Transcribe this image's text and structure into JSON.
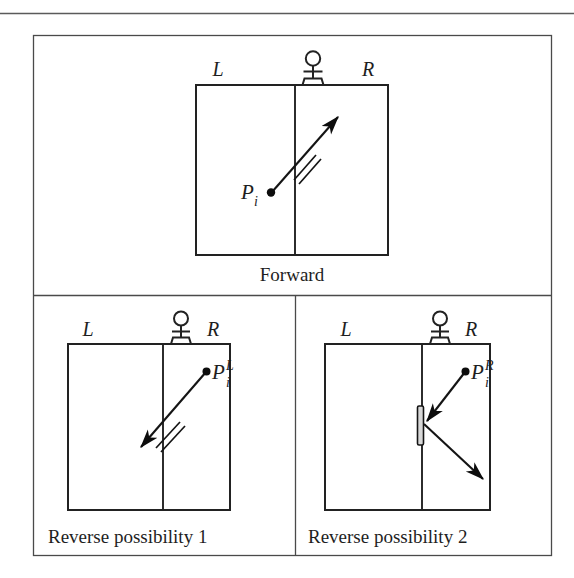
{
  "figure": {
    "name": "forward-reverse-possibility-diagram",
    "top_rule": true,
    "panels": [
      {
        "id": "forward",
        "caption": "Forward",
        "caption_align": "center",
        "left_label": "L",
        "right_label": "R",
        "sensor_icon": "antenna-sensor-icon",
        "point_label_base": "P",
        "point_label_sub": "i",
        "point_label_sup": "",
        "arrow_count": 1,
        "arrow_direction": "up-right",
        "has_tick_mark": true,
        "has_wall_segment": false
      },
      {
        "id": "reverse-possibility-1",
        "caption": "Reverse possibility 1",
        "caption_align": "left",
        "left_label": "L",
        "right_label": "R",
        "sensor_icon": "antenna-sensor-icon",
        "point_label_base": "P",
        "point_label_sub": "i",
        "point_label_sup": "L",
        "arrow_count": 1,
        "arrow_direction": "down-left",
        "has_tick_mark": true,
        "has_wall_segment": false
      },
      {
        "id": "reverse-possibility-2",
        "caption": "Reverse possibility 2",
        "caption_align": "left",
        "left_label": "L",
        "right_label": "R",
        "sensor_icon": "antenna-sensor-icon",
        "point_label_base": "P",
        "point_label_sub": "i",
        "point_label_sup": "R",
        "arrow_count": 2,
        "arrow_direction": "down-left-then-down-right",
        "has_tick_mark": false,
        "has_wall_segment": true
      }
    ],
    "colors": {
      "ink": "#1a1a1a",
      "frame": "#4a4a4a",
      "box": "#222222",
      "arrow": "#141414",
      "wall_fill": "#d8d8d8",
      "background": "#ffffff"
    }
  }
}
